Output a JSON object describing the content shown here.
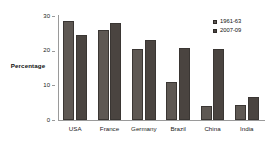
{
  "chart_data": {
    "type": "bar",
    "title": "",
    "xlabel": "",
    "ylabel": "Percentage",
    "ylim": [
      0,
      30
    ],
    "yticks": [
      0,
      10,
      20,
      30
    ],
    "grid": false,
    "legend_position": "top-right",
    "categories": [
      "USA",
      "France",
      "Germany",
      "Brazil",
      "China",
      "India"
    ],
    "series": [
      {
        "name": "1961-63",
        "color": "#5e5853",
        "values": [
          28.5,
          26.0,
          20.6,
          11.0,
          4.1,
          4.3
        ]
      },
      {
        "name": "2007-09",
        "color": "#4a4440",
        "values": [
          24.6,
          28.1,
          23.1,
          20.9,
          20.6,
          6.7
        ]
      }
    ]
  },
  "legend": {
    "items": [
      {
        "label": "1961-63"
      },
      {
        "label": "2007-09"
      }
    ]
  },
  "axis": {
    "y_title": "Percentage",
    "y_tick_labels": [
      "30",
      "20",
      "10",
      "0"
    ],
    "x_tick_labels": [
      "USA",
      "France",
      "Germany",
      "Brazil",
      "China",
      "India"
    ]
  }
}
